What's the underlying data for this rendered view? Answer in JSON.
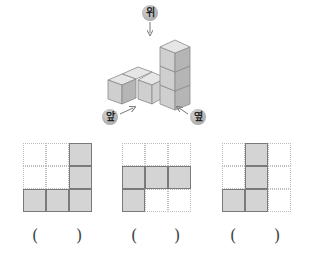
{
  "figure": {
    "labels": {
      "top": "위",
      "front": "앞",
      "side": "옆"
    }
  },
  "options": [
    {
      "grid": [
        [
          0,
          0,
          1
        ],
        [
          0,
          0,
          1
        ],
        [
          1,
          1,
          1
        ]
      ],
      "answer_open": "(",
      "answer_close": ")"
    },
    {
      "grid": [
        [
          0,
          0,
          0
        ],
        [
          1,
          1,
          1
        ],
        [
          1,
          0,
          0
        ]
      ],
      "answer_open": "(",
      "answer_close": ")"
    },
    {
      "grid": [
        [
          0,
          1,
          0
        ],
        [
          0,
          1,
          0
        ],
        [
          1,
          1,
          0
        ]
      ],
      "answer_open": "(",
      "answer_close": ")"
    }
  ],
  "colors": {
    "cube_front": "#cfcfcf",
    "cube_side": "#b5b5b5",
    "cube_top": "#e6e6e6",
    "edge": "#8a8a8a",
    "filled_cell": "#d4d4d4"
  }
}
